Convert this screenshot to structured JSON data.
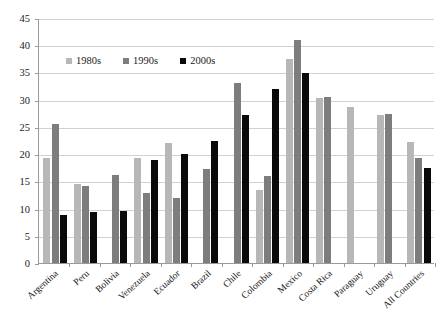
{
  "chart_data": {
    "type": "bar",
    "title": "",
    "subtitle": "",
    "xlabel": "",
    "ylabel": "",
    "ylim": [
      0,
      45
    ],
    "ytick_step": 5,
    "yticks": [
      0,
      5,
      10,
      15,
      20,
      25,
      30,
      35,
      40,
      45
    ],
    "grid": true,
    "legend_position": "top-left-inside",
    "categories": [
      "Argentina",
      "Peru",
      "Bolivia",
      "Venezuela",
      "Ecuador",
      "Brazil",
      "Chile",
      "Colombia",
      "Mexico",
      "Costa Rica",
      "Paraguay",
      "Uruguay",
      "All Countries"
    ],
    "series": [
      {
        "name": "1980s",
        "color": "#b7b7b7",
        "values": [
          19.3,
          14.6,
          null,
          19.3,
          22.0,
          null,
          null,
          13.4,
          37.4,
          30.4,
          28.7,
          27.1,
          22.3
        ]
      },
      {
        "name": "1990s",
        "color": "#7d7d7d",
        "values": [
          25.5,
          14.2,
          16.2,
          12.8,
          12.0,
          17.3,
          33.1,
          16.0,
          41.0,
          30.5,
          null,
          27.4,
          19.3
        ]
      },
      {
        "name": "2000s",
        "color": "#0a0a0a",
        "values": [
          8.9,
          9.3,
          9.5,
          18.9,
          20.0,
          22.4,
          27.2,
          32.0,
          34.9,
          null,
          null,
          null,
          17.5
        ]
      }
    ]
  }
}
